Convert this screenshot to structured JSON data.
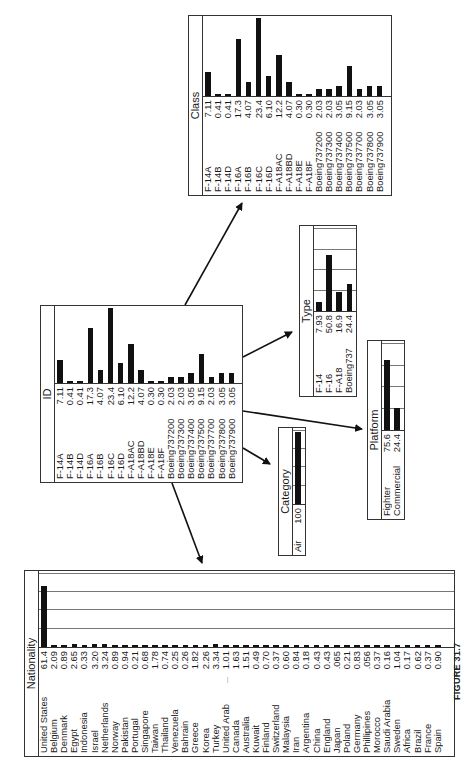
{
  "figure": {
    "caption": "FIGURE 31.7",
    "orientation": "rotated 90° counter-clockwise"
  },
  "panels": {
    "id": {
      "title": "ID",
      "rows": [
        {
          "label": "F-14A",
          "value": "7.11",
          "v": 7.11
        },
        {
          "label": "F-14B",
          "value": "0.41",
          "v": 0.41
        },
        {
          "label": "F-14D",
          "value": "0.41",
          "v": 0.41
        },
        {
          "label": "F-16A",
          "value": "17.3",
          "v": 17.3
        },
        {
          "label": "F-16B",
          "value": "4.07",
          "v": 4.07
        },
        {
          "label": "F-16C",
          "value": "23.4",
          "v": 23.4
        },
        {
          "label": "F-16D",
          "value": "6.10",
          "v": 6.1
        },
        {
          "label": "F-A18AC",
          "value": "12.2",
          "v": 12.2
        },
        {
          "label": "F-A18BD",
          "value": "4.07",
          "v": 4.07
        },
        {
          "label": "F-A18E",
          "value": "0.30",
          "v": 0.3
        },
        {
          "label": "F-A18F",
          "value": "0.30",
          "v": 0.3
        },
        {
          "label": "Boeing737200",
          "value": "2.03",
          "v": 2.03
        },
        {
          "label": "Boeing737300",
          "value": "2.03",
          "v": 2.03
        },
        {
          "label": "Boeing737400",
          "value": "3.05",
          "v": 3.05
        },
        {
          "label": "Boeing737500",
          "value": "9.15",
          "v": 9.15
        },
        {
          "label": "Boeing737700",
          "value": "2.03",
          "v": 2.03
        },
        {
          "label": "Boeing737800",
          "value": "3.05",
          "v": 3.05
        },
        {
          "label": "Boeing737900",
          "value": "3.05",
          "v": 3.05
        }
      ]
    },
    "class": {
      "title": "Class",
      "rows": [
        {
          "label": "F-14A",
          "value": "7.11",
          "v": 7.11
        },
        {
          "label": "F-14B",
          "value": "0.41",
          "v": 0.41
        },
        {
          "label": "F-14D",
          "value": "0.41",
          "v": 0.41
        },
        {
          "label": "F-16A",
          "value": "17.3",
          "v": 17.3
        },
        {
          "label": "F-16B",
          "value": "4.07",
          "v": 4.07
        },
        {
          "label": "F-16C",
          "value": "23.4",
          "v": 23.4
        },
        {
          "label": "F-16D",
          "value": "6.10",
          "v": 6.1
        },
        {
          "label": "F-A18AC",
          "value": "12.2",
          "v": 12.2
        },
        {
          "label": "F-A18BD",
          "value": "4.07",
          "v": 4.07
        },
        {
          "label": "F-A18E",
          "value": "0.30",
          "v": 0.3
        },
        {
          "label": "F-A18F",
          "value": "0.30",
          "v": 0.3
        },
        {
          "label": "Boeing737200",
          "value": "2.03",
          "v": 2.03
        },
        {
          "label": "Boeing737300",
          "value": "2.03",
          "v": 2.03
        },
        {
          "label": "Boeing737400",
          "value": "3.05",
          "v": 3.05
        },
        {
          "label": "Boeing737500",
          "value": "9.15",
          "v": 9.15
        },
        {
          "label": "Boeing737700",
          "value": "2.03",
          "v": 2.03
        },
        {
          "label": "Boeing737800",
          "value": "3.05",
          "v": 3.05
        },
        {
          "label": "Boeing737900",
          "value": "3.05",
          "v": 3.05
        }
      ]
    },
    "type": {
      "title": "Type",
      "rows": [
        {
          "label": "F-14",
          "value": "7.93",
          "v": 7.93
        },
        {
          "label": "F-16",
          "value": "50.8",
          "v": 50.8
        },
        {
          "label": "F-A18",
          "value": "16.9",
          "v": 16.9
        },
        {
          "label": "Boeing737",
          "value": "24.4",
          "v": 24.4
        }
      ]
    },
    "platform": {
      "title": "Platform",
      "rows": [
        {
          "label": "Fighter",
          "value": "75.6",
          "v": 75.6
        },
        {
          "label": "Commercial",
          "value": "24.4",
          "v": 24.4
        }
      ]
    },
    "category": {
      "title": "Category",
      "rows": [
        {
          "label": "Air",
          "value": "100",
          "v": 100
        }
      ]
    },
    "nationality": {
      "title": "Nationality",
      "rows": [
        {
          "label": "United States",
          "value": "61.4",
          "v": 61.4
        },
        {
          "label": "Belgium",
          "value": "2.09",
          "v": 2.09
        },
        {
          "label": "Denmark",
          "value": "0.89",
          "v": 0.89
        },
        {
          "label": "Egypt",
          "value": "2.65",
          "v": 2.65
        },
        {
          "label": "Indonesia",
          "value": "0.33",
          "v": 0.33
        },
        {
          "label": "Israel",
          "value": "3.20",
          "v": 3.2
        },
        {
          "label": "Netherlands",
          "value": "3.24",
          "v": 3.24
        },
        {
          "label": "Norway",
          "value": "0.89",
          "v": 0.89
        },
        {
          "label": "Pakistan",
          "value": "0.94",
          "v": 0.94
        },
        {
          "label": "Portugal",
          "value": "0.21",
          "v": 0.21
        },
        {
          "label": "Singapore",
          "value": "0.68",
          "v": 0.68
        },
        {
          "label": "Taiwan",
          "value": "1.78",
          "v": 1.78
        },
        {
          "label": "Thailand",
          "value": "0.74",
          "v": 0.74
        },
        {
          "label": "Venezuela",
          "value": "0.25",
          "v": 0.25
        },
        {
          "label": "Bahrain",
          "value": "0.26",
          "v": 0.26
        },
        {
          "label": "Greece",
          "value": "1.82",
          "v": 1.82
        },
        {
          "label": "Korea",
          "value": "2.26",
          "v": 2.26
        },
        {
          "label": "Turkey",
          "value": "3.34",
          "v": 3.34
        },
        {
          "label": "United Arab",
          "value": "1.01",
          "v": 1.01,
          "ellipsis": "..."
        },
        {
          "label": "Canada",
          "value": "1.63",
          "v": 1.63
        },
        {
          "label": "Australia",
          "value": "1.51",
          "v": 1.51
        },
        {
          "label": "Kuwait",
          "value": "0.49",
          "v": 0.49
        },
        {
          "label": "Finland",
          "value": "0.70",
          "v": 0.7
        },
        {
          "label": "Switzerland",
          "value": "0.37",
          "v": 0.37
        },
        {
          "label": "Malaysia",
          "value": "0.60",
          "v": 0.6
        },
        {
          "label": "Iran",
          "value": "0.84",
          "v": 0.84
        },
        {
          "label": "Argentina",
          "value": "0.18",
          "v": 0.18
        },
        {
          "label": "China",
          "value": "0.43",
          "v": 0.43
        },
        {
          "label": "England",
          "value": "0.43",
          "v": 0.43
        },
        {
          "label": "Japan",
          "value": ".065",
          "v": 0.065
        },
        {
          "label": "Poland",
          "value": "0.21",
          "v": 0.21
        },
        {
          "label": "Germany",
          "value": "0.83",
          "v": 0.83
        },
        {
          "label": "Phillipines",
          "value": ".056",
          "v": 0.056
        },
        {
          "label": "Morocco",
          "value": "0.37",
          "v": 0.37
        },
        {
          "label": "Saudi Arabia",
          "value": "0.16",
          "v": 0.16
        },
        {
          "label": "Sweden",
          "value": "1.04",
          "v": 1.04
        },
        {
          "label": "Africa",
          "value": "0.17",
          "v": 0.17
        },
        {
          "label": "Brazil",
          "value": "0.62",
          "v": 0.62
        },
        {
          "label": "France",
          "value": "0.37",
          "v": 0.37
        },
        {
          "label": "Spain",
          "value": "0.90",
          "v": 0.9
        }
      ]
    }
  },
  "edges": [
    {
      "from": "ID",
      "to": "Class"
    },
    {
      "from": "ID",
      "to": "Type"
    },
    {
      "from": "ID",
      "to": "Platform"
    },
    {
      "from": "ID",
      "to": "Category"
    },
    {
      "from": "ID",
      "to": "Nationality"
    }
  ]
}
